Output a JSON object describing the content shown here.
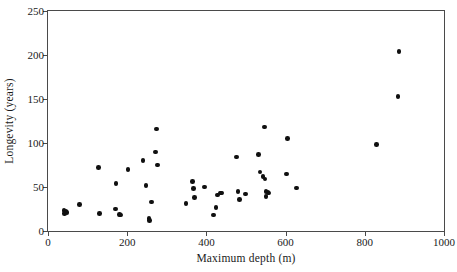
{
  "chart_data": {
    "type": "scatter",
    "title": "",
    "xlabel": "Maximum depth (m)",
    "ylabel": "Longevity (years)",
    "xlim": [
      0,
      1000
    ],
    "ylim": [
      0,
      250
    ],
    "xticks": [
      0,
      200,
      400,
      600,
      800,
      1000
    ],
    "yticks": [
      0,
      50,
      100,
      150,
      200,
      250
    ],
    "xtick_labels": [
      "0",
      "200",
      "400",
      "600",
      "800",
      "1000"
    ],
    "ytick_labels": [
      "0",
      "50",
      "100",
      "150",
      "200",
      "250"
    ],
    "grid": false,
    "legend": false,
    "marker": "filled-circle",
    "marker_color": "#101010",
    "frame_color": "#4a4a4a",
    "background": "#ffffff",
    "n_points": 49,
    "points": [
      [
        40,
        23
      ],
      [
        42,
        20
      ],
      [
        45,
        22
      ],
      [
        48,
        21
      ],
      [
        80,
        30
      ],
      [
        128,
        72
      ],
      [
        130,
        20
      ],
      [
        170,
        25
      ],
      [
        172,
        54
      ],
      [
        180,
        19
      ],
      [
        183,
        18
      ],
      [
        202,
        70
      ],
      [
        240,
        80
      ],
      [
        247,
        52
      ],
      [
        255,
        14
      ],
      [
        257,
        12
      ],
      [
        262,
        33
      ],
      [
        272,
        90
      ],
      [
        274,
        116
      ],
      [
        276,
        75
      ],
      [
        348,
        31
      ],
      [
        365,
        56
      ],
      [
        367,
        48
      ],
      [
        370,
        38
      ],
      [
        395,
        50
      ],
      [
        418,
        18
      ],
      [
        424,
        27
      ],
      [
        428,
        41
      ],
      [
        435,
        43
      ],
      [
        438,
        43
      ],
      [
        476,
        84
      ],
      [
        480,
        45
      ],
      [
        483,
        36
      ],
      [
        498,
        42
      ],
      [
        532,
        87
      ],
      [
        535,
        67
      ],
      [
        543,
        62
      ],
      [
        546,
        118
      ],
      [
        548,
        59
      ],
      [
        550,
        45
      ],
      [
        551,
        39
      ],
      [
        556,
        44
      ],
      [
        558,
        43
      ],
      [
        603,
        65
      ],
      [
        605,
        105
      ],
      [
        628,
        49
      ],
      [
        830,
        98
      ],
      [
        884,
        153
      ],
      [
        886,
        204
      ]
    ]
  }
}
